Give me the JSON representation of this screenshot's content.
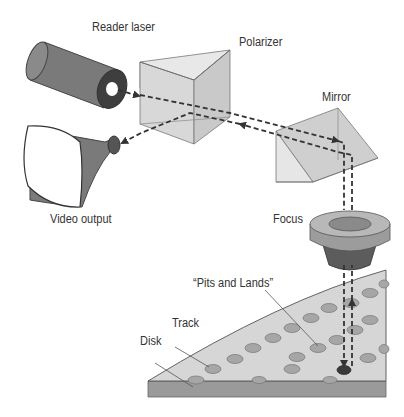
{
  "diagram": {
    "labels": {
      "reader_laser": "Reader laser",
      "polarizer": "Polarizer",
      "mirror": "Mirror",
      "video_output": "Video output",
      "focus": "Focus",
      "pits_and_lands": "“Pits and Lands”",
      "track": "Track",
      "disk": "Disk"
    },
    "components": [
      "reader-laser",
      "polarizer-prism",
      "mirror-prism",
      "video-output-monitor",
      "focus-lens",
      "disk"
    ],
    "beam_path": [
      "Reader laser",
      "Polarizer",
      "Mirror",
      "Focus",
      "Disk",
      "Focus",
      "Mirror",
      "Polarizer",
      "Video output"
    ],
    "colors": {
      "dark_gray": "#6b6b6b",
      "mid_gray": "#9a9a9a",
      "light_gray": "#d6d6d6",
      "prism_fill": "#dedede",
      "beam": "#333333"
    }
  }
}
